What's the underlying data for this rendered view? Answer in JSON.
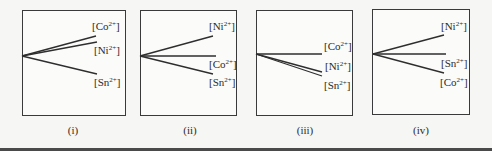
{
  "figure": {
    "panels": [
      {
        "caption": "(i)",
        "box": {
          "x": 22,
          "y": 10,
          "w": 104,
          "h": 106
        },
        "origin": {
          "x": 22,
          "y": 56
        },
        "series": [
          {
            "ion": "Co",
            "charge": "2+",
            "end": {
              "x": 96,
              "y": 36
            },
            "label_pos": {
              "x": 92,
              "y": 21
            }
          },
          {
            "ion": "Ni",
            "charge": "2+",
            "end": {
              "x": 97,
              "y": 42
            },
            "label_pos": {
              "x": 94,
              "y": 45
            }
          },
          {
            "ion": "Sn",
            "charge": "2+",
            "end": {
              "x": 97,
              "y": 74
            },
            "label_pos": {
              "x": 94,
              "y": 77
            }
          }
        ]
      },
      {
        "caption": "(ii)",
        "box": {
          "x": 140,
          "y": 10,
          "w": 97,
          "h": 106
        },
        "origin": {
          "x": 140,
          "y": 56
        },
        "series": [
          {
            "ion": "Ni",
            "charge": "2+",
            "end": {
              "x": 213,
              "y": 36
            },
            "label_pos": {
              "x": 209,
              "y": 21
            }
          },
          {
            "ion": "Co",
            "charge": "2+",
            "end": {
              "x": 216,
              "y": 56
            },
            "label_pos": {
              "x": 209,
              "y": 59
            }
          },
          {
            "ion": "Sn",
            "charge": "2+",
            "end": {
              "x": 213,
              "y": 74
            },
            "label_pos": {
              "x": 209,
              "y": 77
            }
          }
        ]
      },
      {
        "caption": "(iii)",
        "box": {
          "x": 256,
          "y": 10,
          "w": 97,
          "h": 106
        },
        "origin": {
          "x": 256,
          "y": 54
        },
        "series": [
          {
            "ion": "Co",
            "charge": "2+",
            "end": {
              "x": 322,
              "y": 54
            },
            "label_pos": {
              "x": 324,
              "y": 41
            }
          },
          {
            "ion": "Ni",
            "charge": "2+",
            "end": {
              "x": 322,
              "y": 72
            },
            "label_pos": {
              "x": 325,
              "y": 61
            }
          },
          {
            "ion": "Sn",
            "charge": "2+",
            "end": {
              "x": 322,
              "y": 76
            },
            "label_pos": {
              "x": 324,
              "y": 80
            }
          }
        ]
      },
      {
        "caption": "(iv)",
        "box": {
          "x": 372,
          "y": 9,
          "w": 98,
          "h": 106
        },
        "origin": {
          "x": 373,
          "y": 54
        },
        "series": [
          {
            "ion": "Ni",
            "charge": "2+",
            "end": {
              "x": 444,
              "y": 35
            },
            "label_pos": {
              "x": 441,
              "y": 21
            }
          },
          {
            "ion": "Sn",
            "charge": "2+",
            "end": {
              "x": 446,
              "y": 54
            },
            "label_pos": {
              "x": 441,
              "y": 58
            }
          },
          {
            "ion": "Co",
            "charge": "2+",
            "end": {
              "x": 444,
              "y": 73
            },
            "label_pos": {
              "x": 440,
              "y": 77
            }
          }
        ]
      }
    ],
    "caption_x": [
      73,
      190,
      305,
      421
    ]
  },
  "labels": {
    "p0": {
      "caption": "(i)",
      "s0": "Co",
      "s1": "Ni",
      "s2": "Sn",
      "charge": "2+"
    },
    "p1": {
      "caption": "(ii)",
      "s0": "Ni",
      "s1": "Co",
      "s2": "Sn",
      "charge": "2+"
    },
    "p2": {
      "caption": "(iii)",
      "s0": "Co",
      "s1": "Ni",
      "s2": "Sn",
      "charge": "2+"
    },
    "p3": {
      "caption": "(iv)",
      "s0": "Ni",
      "s1": "Sn",
      "s2": "Co",
      "charge": "2+"
    }
  }
}
